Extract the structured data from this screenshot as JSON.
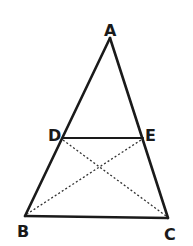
{
  "diagram": {
    "type": "geometry-triangle",
    "stroke_color": "#1a1a1a",
    "background": "#ffffff",
    "points": {
      "A": {
        "label": "A",
        "x": 110,
        "y": 38
      },
      "B": {
        "label": "B",
        "x": 25,
        "y": 216
      },
      "C": {
        "label": "C",
        "x": 168,
        "y": 218
      },
      "D": {
        "label": "D",
        "x": 63,
        "y": 138
      },
      "E": {
        "label": "E",
        "x": 143,
        "y": 138
      }
    },
    "solid_segments": [
      "AB",
      "AC",
      "BC",
      "DE"
    ],
    "dashed_segments": [
      "DC",
      "EB"
    ]
  }
}
